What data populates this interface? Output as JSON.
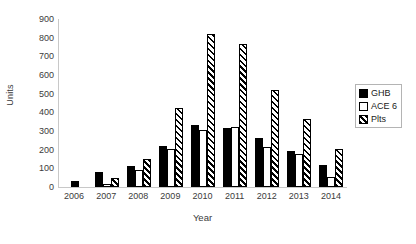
{
  "chart_data": {
    "type": "bar",
    "title": "",
    "xlabel": "Year",
    "ylabel": "Units",
    "ylim": [
      0,
      900
    ],
    "yticks": [
      0,
      100,
      200,
      300,
      400,
      500,
      600,
      700,
      800,
      900
    ],
    "grid": false,
    "legend_position": "right",
    "categories": [
      "2006",
      "2007",
      "2008",
      "2009",
      "2010",
      "2011",
      "2012",
      "2013",
      "2014"
    ],
    "series": [
      {
        "name": "GHB",
        "pattern": "solid-black",
        "values": [
          30,
          80,
          110,
          220,
          330,
          315,
          260,
          195,
          120
        ]
      },
      {
        "name": "ACE 6",
        "pattern": "dotted",
        "values": [
          0,
          15,
          90,
          205,
          305,
          320,
          215,
          175,
          55
        ]
      },
      {
        "name": "Plts",
        "pattern": "diagonal-hatch",
        "values": [
          0,
          50,
          150,
          425,
          820,
          765,
          520,
          365,
          205
        ]
      }
    ]
  },
  "axes": {
    "y_title": "Units",
    "x_title": "Year",
    "y_ticks": [
      "900",
      "800",
      "700",
      "600",
      "500",
      "400",
      "300",
      "200",
      "100",
      "0"
    ],
    "x_ticks": [
      "2006",
      "2007",
      "2008",
      "2009",
      "2010",
      "2011",
      "2012",
      "2013",
      "2014"
    ]
  },
  "legend": {
    "items": [
      {
        "label": "GHB",
        "swatch": "solid-black-swatch"
      },
      {
        "label": "ACE 6",
        "swatch": "dotted-swatch"
      },
      {
        "label": "Plts",
        "swatch": "hatched-swatch"
      }
    ]
  },
  "colors": {
    "ink": "#000000",
    "axis": "#c8c8c8",
    "text": "#3b3b3b",
    "background": "#ffffff"
  }
}
